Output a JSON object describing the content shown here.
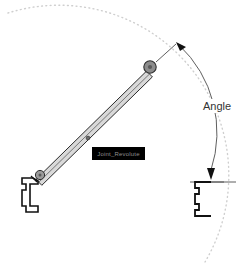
{
  "diagram": {
    "background_color": "#ffffff",
    "annotations": {
      "angle_label": "Angle"
    },
    "tooltip": {
      "text": "Joint_Revolute",
      "background_color": "#000000",
      "text_color": "#8e8e8e"
    },
    "colors": {
      "outline": "#1a1a1a",
      "arm_fill": "#d9d9d9",
      "pivot_fill": "#8c8c8c",
      "pivot_stroke": "#333333",
      "dotted_arc": "#cfcfcf",
      "dimension_line": "#4d4d4d",
      "bracket": "#111111"
    },
    "parts": {
      "upper_pivot_name": "upper-pivot-joint",
      "lower_pivot_name": "lower-pivot-joint",
      "arm_name": "linkage-arm",
      "left_bracket_name": "left-fixed-bracket",
      "right_bracket_name": "right-fixed-bracket",
      "midpoint_marker_name": "arm-midpoint-marker"
    },
    "geometry": {
      "upper_pivot": {
        "cx": 150,
        "cy": 67,
        "r": 6
      },
      "lower_pivot": {
        "cx": 39,
        "cy": 175,
        "r": 4.5
      },
      "arm_midpoint": {
        "cx": 88,
        "cy": 138,
        "r": 1.8
      },
      "dotted_arc_radius": 162,
      "angle_arc_radius": 118,
      "angle_degrees": 46
    }
  }
}
